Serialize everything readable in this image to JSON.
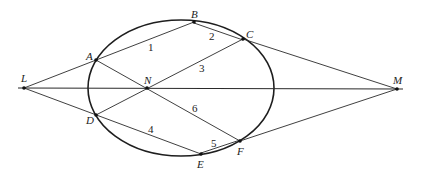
{
  "figure": {
    "width": 421,
    "height": 177,
    "background": "#ffffff",
    "stroke_color": "#2a2a2a"
  },
  "ellipse": {
    "cx": 181,
    "cy": 88,
    "rx": 93,
    "ry": 68
  },
  "points": {
    "L": {
      "label": "L",
      "x": 24,
      "y": 88
    },
    "M": {
      "label": "M",
      "x": 397,
      "y": 89
    },
    "A": {
      "label": "A",
      "x": 96,
      "y": 60
    },
    "B": {
      "label": "B",
      "x": 194,
      "y": 22
    },
    "C": {
      "label": "C",
      "x": 243,
      "y": 39
    },
    "N": {
      "label": "N",
      "x": 147,
      "y": 88
    },
    "D": {
      "label": "D",
      "x": 96,
      "y": 115
    },
    "E": {
      "label": "E",
      "x": 201,
      "y": 154
    },
    "F": {
      "label": "F",
      "x": 240,
      "y": 141
    }
  },
  "segment_labels": {
    "s1": "1",
    "s2": "2",
    "s3": "3",
    "s4": "4",
    "s5": "5",
    "s6": "6"
  }
}
